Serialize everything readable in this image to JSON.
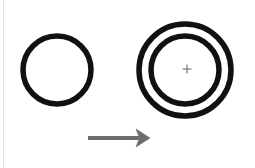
{
  "figure": {
    "background_color": "#ffffff",
    "width": 255,
    "height": 168,
    "stroke_color": "#111111",
    "arrow_color": "#6e6e6e",
    "marker_color": "#7a7a7a",
    "edge_artifact_color": "#e2e2e2",
    "shapes": {
      "source_circle": {
        "label": "single circle",
        "cx": 57,
        "cy": 70,
        "r": 34,
        "stroke_width": 5.5
      },
      "target_outer_circle": {
        "label": "outer circle",
        "cx": 185,
        "cy": 70,
        "r": 46,
        "stroke_width": 5.5
      },
      "target_inner_circle": {
        "label": "inner circle",
        "cx": 185,
        "cy": 70,
        "r": 34,
        "stroke_width": 5.5
      },
      "center_marker": {
        "label": "plus",
        "cx": 187,
        "cy": 69,
        "size": 9,
        "stroke_width": 1.2
      },
      "arrow": {
        "label": "rightward arrow",
        "x_start": 88,
        "x_end": 150,
        "y": 138,
        "shaft_width": 4,
        "head_length": 14,
        "head_half_height": 9
      },
      "edge_artifact": {
        "label": "page edge scan line",
        "x": 3
      }
    }
  }
}
